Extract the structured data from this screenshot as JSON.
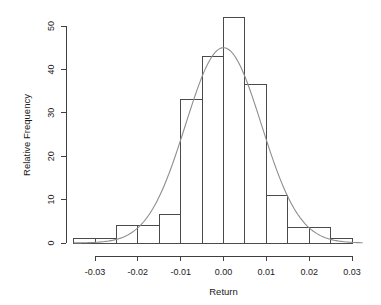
{
  "chart_data": {
    "type": "bar",
    "title": "",
    "subtitle": "",
    "xlabel": "Return",
    "ylabel": "Relative Frequency",
    "xlim": [
      -0.035,
      0.0325
    ],
    "ylim": [
      0,
      53
    ],
    "grid": false,
    "legend": null,
    "bin_width": 0.005,
    "bin_edges": [
      -0.035,
      -0.03,
      -0.025,
      -0.02,
      -0.015,
      -0.01,
      -0.005,
      0.0,
      0.005,
      0.01,
      0.015,
      0.02,
      0.025,
      0.03
    ],
    "categories": [
      "-0.035 to -0.030",
      "-0.030 to -0.025",
      "-0.025 to -0.020",
      "-0.020 to -0.015",
      "-0.015 to -0.010",
      "-0.010 to -0.005",
      "-0.005 to 0.000",
      "0.000 to 0.005",
      "0.005 to 0.010",
      "0.010 to 0.015",
      "0.015 to 0.020",
      "0.020 to 0.025",
      "0.025 to 0.030"
    ],
    "values": [
      1,
      1,
      4,
      4,
      6.5,
      33,
      43,
      52,
      36.5,
      11,
      3.5,
      3.5,
      1
    ],
    "xticks": [
      -0.03,
      -0.02,
      -0.01,
      0.0,
      0.01,
      0.02,
      0.03
    ],
    "xtick_labels": [
      "-0.03",
      "-0.02",
      "-0.01",
      "0.00",
      "0.01",
      "0.02",
      "0.03"
    ],
    "yticks": [
      0,
      10,
      20,
      30,
      40,
      50
    ],
    "ytick_labels": [
      "0",
      "10",
      "20",
      "30",
      "40",
      "50"
    ],
    "overlay": {
      "type": "line",
      "name": "normal-density-curve",
      "mean": 0.0,
      "sd": 0.00885,
      "peak_value": 45,
      "color": "#8e8e8e"
    },
    "colors": {
      "bar_fill": "#ffffff",
      "bar_stroke": "#4a4a4a",
      "curve": "#8e8e8e",
      "axis": "#3f3f3f",
      "text": "#1a1a1a",
      "background": "#ffffff"
    }
  }
}
